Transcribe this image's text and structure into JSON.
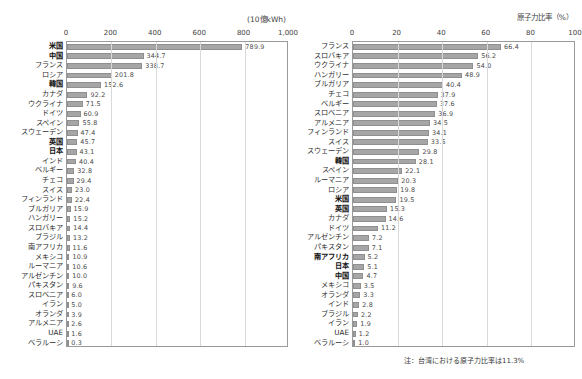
{
  "left": {
    "unit_title": "(10億kWh)",
    "axis_ticks": [
      "0",
      "200",
      "400",
      "600",
      "800",
      "1,000"
    ],
    "axis_values": [
      0,
      200,
      400,
      600,
      800,
      1000
    ],
    "xmax": 1000
  },
  "right": {
    "unit_title": "原子力比率（%）",
    "axis_ticks": [
      "0",
      "20",
      "40",
      "60",
      "80",
      "100"
    ],
    "axis_values": [
      0,
      20,
      40,
      60,
      80,
      100
    ],
    "xmax": 100
  },
  "note": "注：台湾における原子力比率は11.3%",
  "colors": {
    "bar": "#a6a6a6",
    "bar_border": "#8f8f8f",
    "plot_border": "#9a9a9a",
    "gridline": "#d9d9d9",
    "text": "#3a3a3a"
  },
  "chart_data": [
    {
      "type": "bar",
      "title": "原子力発電電力量",
      "xlabel": "(10億kWh)",
      "ylabel": "",
      "xlim": [
        0,
        1000
      ],
      "orientation": "horizontal",
      "grid": true,
      "legend": "none",
      "categories": [
        "米国",
        "中国",
        "フランス",
        "ロシア",
        "韓国",
        "カナダ",
        "ウクライナ",
        "ドイツ",
        "スペイン",
        "スウェーデン",
        "英国",
        "日本",
        "インド",
        "ベルギー",
        "チェコ",
        "スイス",
        "フィンランド",
        "ブルガリア",
        "ハンガリー",
        "スロバキア",
        "ブラジル",
        "南アフリカ",
        "メキシコ",
        "ルーマニア",
        "アルゼンチン",
        "パキスタン",
        "スロベニア",
        "イラン",
        "オランダ",
        "アルメニア",
        "UAE",
        "ベラルーシ"
      ],
      "values": [
        789.9,
        344.7,
        338.7,
        201.8,
        152.6,
        92.2,
        71.5,
        60.9,
        55.8,
        47.4,
        45.7,
        43.1,
        40.4,
        32.8,
        29.4,
        23.0,
        22.4,
        15.9,
        15.2,
        14.4,
        13.2,
        11.6,
        10.9,
        10.6,
        10.0,
        9.6,
        6.0,
        5.0,
        3.9,
        2.6,
        1.6,
        0.3
      ],
      "value_labels": [
        "789.9",
        "344.7",
        "338.7",
        "201.8",
        "152.6",
        "92.2",
        "71.5",
        "60.9",
        "55.8",
        "47.4",
        "45.7",
        "43.1",
        "40.4",
        "32.8",
        "29.4",
        "23.0",
        "22.4",
        "15.9",
        "15.2",
        "14.4",
        "13.2",
        "11.6",
        "10.9",
        "10.6",
        "10.0",
        "9.6",
        "6.0",
        "5.0",
        "3.9",
        "2.6",
        "1.6",
        "0.3"
      ],
      "bold_categories": [
        "米国",
        "中国",
        "韓国",
        "英国",
        "日本"
      ]
    },
    {
      "type": "bar",
      "title": "原子力比率",
      "xlabel": "原子力比率（%）",
      "ylabel": "",
      "xlim": [
        0,
        100
      ],
      "orientation": "horizontal",
      "grid": true,
      "legend": "none",
      "categories": [
        "フランス",
        "スロバキア",
        "ウクライナ",
        "ハンガリー",
        "ブルガリア",
        "チェコ",
        "ベルギー",
        "スロベニア",
        "アルメニア",
        "フィンランド",
        "スイス",
        "スウェーデン",
        "韓国",
        "スペイン",
        "ルーマニア",
        "ロシア",
        "米国",
        "英国",
        "カナダ",
        "ドイツ",
        "アルゼンチン",
        "パキスタン",
        "南アフリカ",
        "日本",
        "中国",
        "メキシコ",
        "オランダ",
        "インド",
        "ブラジル",
        "イラン",
        "UAE",
        "ベラルーシ"
      ],
      "values": [
        66.4,
        56.2,
        54.0,
        48.9,
        40.4,
        37.9,
        37.6,
        36.9,
        34.5,
        34.1,
        33.5,
        29.8,
        28.1,
        22.1,
        20.3,
        19.8,
        19.5,
        15.3,
        14.6,
        11.2,
        7.2,
        7.1,
        5.2,
        5.1,
        4.7,
        3.5,
        3.3,
        2.8,
        2.2,
        1.9,
        1.2,
        1.0
      ],
      "value_labels": [
        "66.4",
        "56.2",
        "54.0",
        "48.9",
        "40.4",
        "37.9",
        "37.6",
        "36.9",
        "34.5",
        "34.1",
        "33.5",
        "29.8",
        "28.1",
        "22.1",
        "20.3",
        "19.8",
        "19.5",
        "15.3",
        "14.6",
        "11.2",
        "7.2",
        "7.1",
        "5.2",
        "5.1",
        "4.7",
        "3.5",
        "3.3",
        "2.8",
        "2.2",
        "1.9",
        "1.2",
        "1.0"
      ],
      "bold_categories": [
        "韓国",
        "米国",
        "英国",
        "日本",
        "中国",
        "南アフリカ"
      ]
    }
  ]
}
